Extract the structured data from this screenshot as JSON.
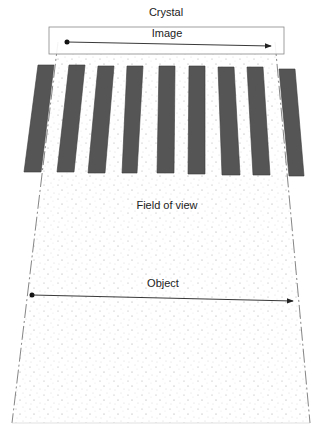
{
  "labels": {
    "crystal": "Crystal",
    "image": "Image",
    "field_of_view": "Field of view",
    "object": "Object"
  },
  "colors": {
    "bar_fill": "#555555",
    "line": "#333333",
    "stipple": "#9a9a9a",
    "box_stroke": "#888888"
  },
  "bars": [
    {
      "pts": "38,65 54,65 41,172 24,172"
    },
    {
      "pts": "69,65 85,65 74,172 57,172"
    },
    {
      "pts": "98,66 114,66 105,173 88,173"
    },
    {
      "pts": "127,66 143,66 137,173 122,173"
    },
    {
      "pts": "159,66 175,66 174,173 157,173"
    },
    {
      "pts": "189,66 205,66 205,174 188,174"
    },
    {
      "pts": "218,67 234,67 240,175 222,175"
    },
    {
      "pts": "247,67 263,67 270,175 253,175"
    },
    {
      "pts": "279,69 295,69 304,176 289,176"
    }
  ]
}
